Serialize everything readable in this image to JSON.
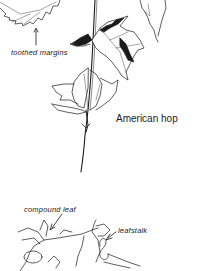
{
  "illustration": {
    "subject": "American hop",
    "labels": {
      "toothed_margins": "toothed margins",
      "species_name": "American hop",
      "compound_leaf": "compound leaf",
      "leafstalk": "leafstalk"
    },
    "colors": {
      "background": "#ffffff",
      "ink": "#1a1a1a"
    }
  }
}
